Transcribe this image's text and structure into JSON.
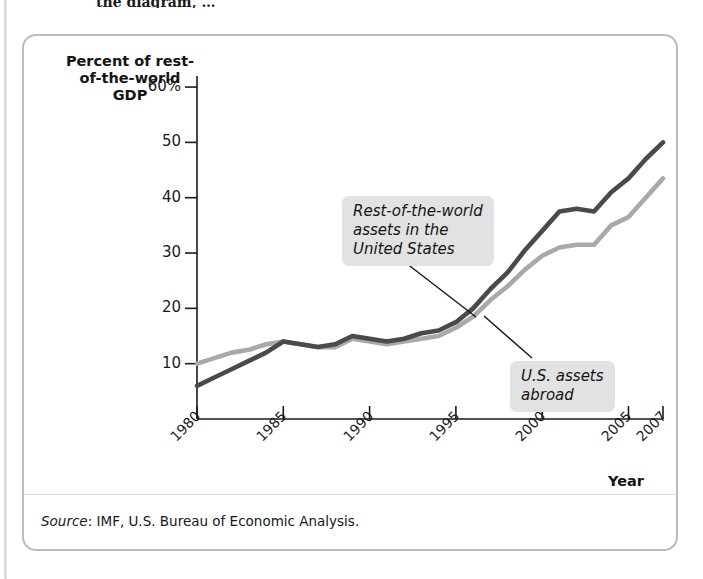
{
  "page": {
    "top_text_fragment": "the diagram, …"
  },
  "figure": {
    "source_label": "Source",
    "source_text": ": IMF, U.S. Bureau of Economic Analysis."
  },
  "chart_data": {
    "type": "line",
    "title": "",
    "ylabel": "Percent of\nrest-of-the-world\nGDP",
    "xlabel": "Year",
    "ylim": [
      0,
      62
    ],
    "xlim": [
      1980,
      2007
    ],
    "grid": false,
    "legend": "annotations",
    "ytick_labels": [
      "60%",
      "50",
      "40",
      "30",
      "20",
      "10"
    ],
    "ytick_values": [
      60,
      50,
      40,
      30,
      20,
      10
    ],
    "xtick_labels": [
      "1980",
      "1985",
      "1990",
      "1995",
      "2000",
      "2005",
      "2007"
    ],
    "xtick_values": [
      1980,
      1985,
      1990,
      1995,
      2000,
      2005,
      2007
    ],
    "x": [
      1980,
      1981,
      1982,
      1983,
      1984,
      1985,
      1986,
      1987,
      1988,
      1989,
      1990,
      1991,
      1992,
      1993,
      1994,
      1995,
      1996,
      1997,
      1998,
      1999,
      2000,
      2001,
      2002,
      2003,
      2004,
      2005,
      2006,
      2007
    ],
    "series": [
      {
        "name": "Rest-of-the-world assets in the United States",
        "color": "#4a4a4a",
        "values": [
          6,
          7.5,
          9,
          10.5,
          12,
          14,
          13.5,
          13,
          13.5,
          15,
          14.5,
          14,
          14.5,
          15.5,
          16,
          17.5,
          20,
          23.5,
          26.5,
          30.5,
          34,
          37.5,
          38,
          37.5,
          41,
          43.5,
          47,
          50
        ]
      },
      {
        "name": "U.S. assets abroad",
        "color": "#a9a9a9",
        "values": [
          10,
          11,
          12,
          12.5,
          13.5,
          14,
          13.5,
          13,
          13,
          14.5,
          14,
          13.5,
          14,
          14.5,
          15,
          16.5,
          18.5,
          21.5,
          24,
          27,
          29.5,
          31,
          31.5,
          31.5,
          35,
          36.5,
          40,
          43.5
        ]
      }
    ],
    "annotations": [
      {
        "id": "callout-row",
        "text": "Rest-of-the-world\nassets in the\nUnited States",
        "target_series": "Rest-of-the-world assets in the United States"
      },
      {
        "id": "callout-us",
        "text": "U.S. assets\nabroad",
        "target_series": "U.S. assets abroad"
      }
    ]
  }
}
